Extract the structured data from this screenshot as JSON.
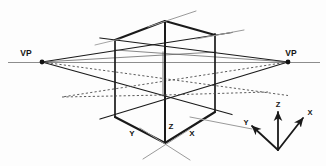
{
  "figure": {
    "background_color": "#fdfdfd",
    "width": 326,
    "height": 166,
    "labels": {
      "vanishing_point_left": "VP",
      "vanishing_point_right": "VP",
      "axis_y_main": "Y",
      "axis_z_main": "Z",
      "axis_x_main": "X",
      "triad_z": "Z",
      "triad_x": "X",
      "triad_y": "Y"
    },
    "colors": {
      "solid_line": "#1a1a1a",
      "hidden_line": "#4a4a4a",
      "guide_line": "#9a9a9a",
      "horizon_line": "#8d8d8d",
      "text": "#151515"
    },
    "geometry": {
      "horizon_y": 62,
      "vp_left": [
        42,
        62
      ],
      "vp_right": [
        288,
        62
      ],
      "front_vertical_x": 165,
      "left_vertical_x": 115,
      "right_vertical_x": 215,
      "apex_top": [
        165,
        21
      ],
      "apex_bottom": [
        165,
        143
      ],
      "top_left_corner": [
        115,
        40
      ],
      "top_right_corner": [
        215,
        35
      ],
      "bottom_left_corner": [
        115,
        117
      ],
      "bottom_right_corner": [
        215,
        112
      ],
      "back_vertical_top": [
        165,
        50
      ],
      "back_vertical_bottom": [
        165,
        95
      ]
    },
    "line_styles": {
      "visible_edges": "solid",
      "hidden_edges": "dotted",
      "construction_rays": "solid-thin",
      "horizon": "thin-gray"
    },
    "triad": {
      "origin": [
        278,
        150
      ],
      "z_tip": [
        278,
        108
      ],
      "x_tip": [
        305,
        115
      ],
      "y_tip": [
        250,
        122
      ],
      "arrowheads": true
    },
    "element_names": {
      "horizon": "horizon-line",
      "cube": "perspective-cube",
      "rays": "vanishing-point-rays",
      "triad": "axis-triad"
    }
  }
}
